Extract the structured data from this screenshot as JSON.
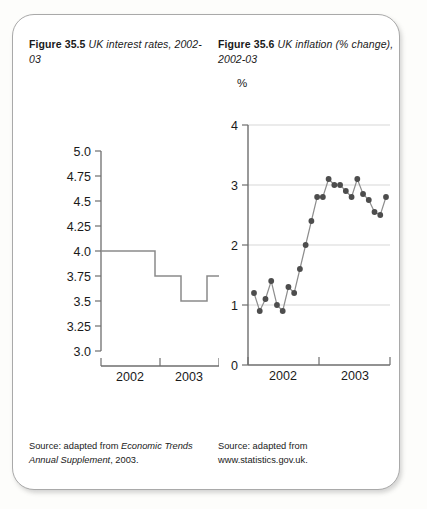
{
  "panel": {
    "background": "#ffffff",
    "border_color": "#a9a9a9"
  },
  "figures": [
    {
      "id": "figure-35-5",
      "number": "Figure 35.5",
      "title": " UK interest rates, 2002-03",
      "source_prefix": "Source: adapted from ",
      "source_italic": "Economic Trends Annual Supplement",
      "source_suffix": ", 2003.",
      "chart_data": {
        "type": "line",
        "title": "UK interest rates, 2002-03",
        "xlabel": "",
        "ylabel": "",
        "ytick_labels": [
          "5.0",
          "4.75",
          "4.5",
          "4.25",
          "4.0",
          "3.75",
          "3.5",
          "3.25",
          "3.0"
        ],
        "ytick_values": [
          5.0,
          4.75,
          4.5,
          4.25,
          4.0,
          3.75,
          3.5,
          3.25,
          3.0
        ],
        "ylim": [
          3.0,
          5.0
        ],
        "xtick_labels": [
          "2002",
          "2003"
        ],
        "xlim": [
          0,
          24
        ],
        "grid": false,
        "line_style": "step",
        "series": [
          {
            "name": "Bank of England base rate (%)",
            "steps": [
              {
                "x_start": 0,
                "x_end": 13,
                "value": 4.0
              },
              {
                "x_start": 13,
                "x_end": 17,
                "value": 3.75
              },
              {
                "x_start": 17,
                "x_end": 21,
                "value": 3.5
              },
              {
                "x_start": 21,
                "x_end": 24,
                "value": 3.75
              }
            ]
          }
        ]
      }
    },
    {
      "id": "figure-35-6",
      "number": "Figure 35.6",
      "title": " UK inflation (% change), 2002-03",
      "axis_unit": "%",
      "source_line1": "Source: adapted from",
      "source_line2": "www.statistics.gov.uk.",
      "chart_data": {
        "type": "line",
        "title": "UK inflation (% change), 2002-03",
        "xlabel": "",
        "ylabel": "%",
        "ytick_labels": [
          "0",
          "1",
          "2",
          "3",
          "4"
        ],
        "ytick_values": [
          0,
          1,
          2,
          3,
          4
        ],
        "ylim": [
          0,
          4
        ],
        "xtick_labels": [
          "2002",
          "2003"
        ],
        "xlim": [
          0,
          25
        ],
        "grid": true,
        "gridlines_at": [
          1,
          2,
          3,
          4
        ],
        "marker": "filled-circle",
        "marker_color": "#4d4d4d",
        "series": [
          {
            "name": "Inflation (% change)",
            "x": [
              1,
              2,
              3,
              4,
              5,
              6,
              7,
              8,
              9,
              10,
              11,
              12,
              13,
              14,
              15,
              16,
              17,
              18,
              19,
              20,
              21,
              22,
              23,
              24
            ],
            "values": [
              1.2,
              0.9,
              1.1,
              1.4,
              1.0,
              0.9,
              1.3,
              1.2,
              1.6,
              2.0,
              2.4,
              2.8,
              2.8,
              3.1,
              3.0,
              3.0,
              2.9,
              2.8,
              3.1,
              2.85,
              2.75,
              2.55,
              2.5,
              2.8
            ]
          }
        ]
      }
    }
  ]
}
